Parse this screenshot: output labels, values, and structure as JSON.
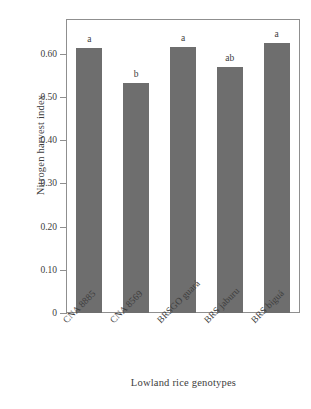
{
  "chart_data": {
    "type": "bar",
    "title": "",
    "subtitle": "",
    "xlabel": "Lowland rice genotypes",
    "ylabel": "Nitrogen harvest index",
    "categories": [
      "CNA 8885",
      "CNA 8569",
      "BRSGO guará",
      "BRS jaburu",
      "BRS biguá"
    ],
    "values": [
      0.612,
      0.532,
      0.616,
      0.569,
      0.625
    ],
    "annotations": [
      "a",
      "b",
      "a",
      "ab",
      "a"
    ],
    "annotation_note": "Tukey significance grouping letters above each bar",
    "ylim": [
      0,
      0.68
    ],
    "yticks": [
      0,
      0.1,
      0.2,
      0.3,
      0.4,
      0.5,
      0.6
    ],
    "ytick_labels": [
      "0",
      "0.10",
      "0.20",
      "0.30",
      "0.40",
      "0.50",
      "0.60"
    ],
    "grid": false,
    "legend": false,
    "legend_position": "none",
    "bar_color": "#6e6e6e",
    "axis_color": "#8f8f8f",
    "text_color": "#3d3d3d",
    "background_color": "#ffffff",
    "xtick_label_rotation": -45
  },
  "axes": {
    "y_title": "Nitrogen harvest index",
    "x_title": "Lowland rice genotypes"
  }
}
